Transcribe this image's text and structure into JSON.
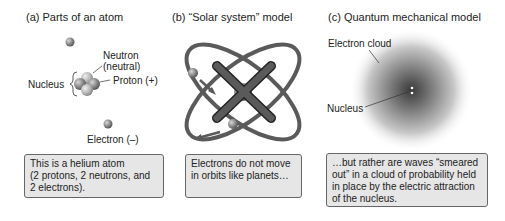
{
  "panels": [
    {
      "title": "(a)  Parts of an atom",
      "labels": {
        "neutron": "Neutron",
        "neutron_sub": "(neutral)",
        "proton": "Proton (+)",
        "nucleus": "Nucleus",
        "electron": "Electron (–)"
      },
      "caption_lines": [
        "This is a helium atom",
        "(2 protons, 2 neutrons, and",
        "2 electrons)."
      ]
    },
    {
      "title": "(b)  “Solar system” model",
      "caption_lines": [
        "Electrons do not move",
        "in orbits like planets…"
      ]
    },
    {
      "title": "(c)  Quantum mechanical model",
      "labels": {
        "cloud": "Electron cloud",
        "nucleus": "Nucleus"
      },
      "caption_lines": [
        "…but rather are waves “smeared",
        "out” in a cloud of probability held",
        "in place by the electric attraction",
        "of the nucleus."
      ]
    }
  ],
  "colors": {
    "caption_bg": "#e6e6e6",
    "orbit": "#5a5a5a",
    "cross": "#444444",
    "particle": "#8a8a8a"
  }
}
